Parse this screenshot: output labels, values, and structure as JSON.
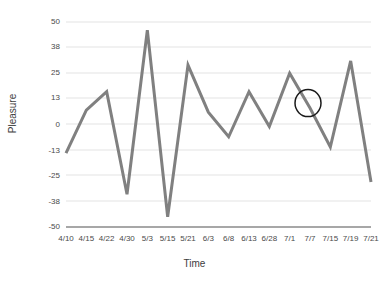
{
  "chart_data": {
    "type": "line",
    "title": "",
    "xlabel": "Time",
    "ylabel": "Pleasure",
    "categories": [
      "4/10",
      "4/15",
      "4/22",
      "4/30",
      "5/3",
      "5/15",
      "5/21",
      "6/3",
      "6/8",
      "6/13",
      "6/28",
      "7/1",
      "7/7",
      "7/15",
      "7/19",
      "7/21"
    ],
    "values": [
      -14,
      7,
      16,
      -34,
      46,
      -45,
      29,
      6,
      -6,
      16,
      -1,
      25,
      8,
      -11,
      31,
      -28
    ],
    "series": [
      {
        "name": "Pleasure",
        "values": [
          -14,
          7,
          16,
          -34,
          46,
          -45,
          29,
          6,
          -6,
          16,
          -1,
          25,
          8,
          -11,
          31,
          -28
        ]
      }
    ],
    "ylim": [
      -50,
      50
    ],
    "yticks": [
      50,
      38,
      25,
      13,
      0,
      -13,
      -25,
      -38,
      -50
    ],
    "ytick_labels": [
      "50",
      "38",
      "25",
      "13",
      "0",
      "-13",
      "-25",
      "-38",
      "-50"
    ],
    "grid": true,
    "legend": "none",
    "line_color": "#808080",
    "grid_color": "#e3e3e3",
    "axis_color": "#808080",
    "annotations": [
      {
        "type": "ellipse",
        "label": "highlight-circle",
        "near_category": "7/7",
        "color": "#1a1a1a"
      }
    ]
  }
}
